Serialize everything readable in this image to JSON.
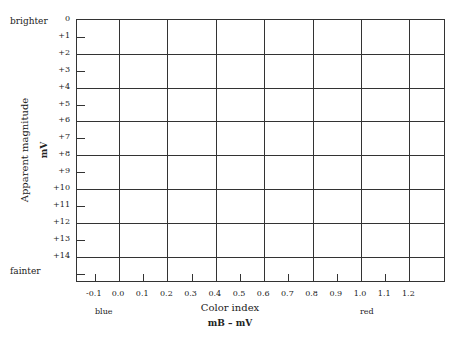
{
  "chart_data": {
    "type": "scatter",
    "title": "",
    "xlabel": "Color index",
    "xlabel_sub": "mB – mV",
    "ylabel": "Apparent magnitude",
    "ylabel_sub": "mV",
    "xlim": [
      -0.2,
      1.4
    ],
    "ylim": [
      16,
      0
    ],
    "y_inverted": true,
    "grid": true,
    "x_ticks": [
      "-0.1",
      "0.0",
      "0.1",
      "0.2",
      "0.3",
      "0.4",
      "0.5",
      "0.6",
      "0.7",
      "0.8",
      "0.9",
      "1.0",
      "1.1",
      "1.2"
    ],
    "y_ticks": [
      "0",
      "+1",
      "+2",
      "+3",
      "+4",
      "+5",
      "+6",
      "+7",
      "+8",
      "+9",
      "+10",
      "+11",
      "+12",
      "+13",
      "+14"
    ],
    "annotations": {
      "y_top": "brighter",
      "y_bottom": "fainter",
      "x_left": "blue",
      "x_right": "red"
    },
    "series": []
  },
  "labels": {
    "brighter": "brighter",
    "fainter": "fainter",
    "blue": "blue",
    "red": "red",
    "ytitle": "Apparent magnitude",
    "ysub": "mV",
    "xtitle": "Color index",
    "xsub": "mB – mV"
  },
  "yticks": [
    "0",
    "+1",
    "+2",
    "+3",
    "+4",
    "+5",
    "+6",
    "+7",
    "+8",
    "+9",
    "+10",
    "+11",
    "+12",
    "+13",
    "+14"
  ],
  "xticks": [
    "-0.1",
    "0.0",
    "0.1",
    "0.2",
    "0.3",
    "0.4",
    "0.5",
    "0.6",
    "0.7",
    "0.8",
    "0.9",
    "1.0",
    "1.1",
    "1.2"
  ]
}
